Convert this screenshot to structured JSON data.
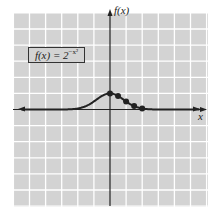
{
  "chart_data": {
    "type": "line",
    "title": "",
    "function_label": {
      "lhs": "f(x) = 2",
      "exponent": "−x²"
    },
    "xlabel": "x",
    "ylabel": "f(x)",
    "xlim": [
      -6,
      6
    ],
    "ylim": [
      -6,
      6
    ],
    "grid": true,
    "grid_step": 1,
    "curve": {
      "x": [
        -6,
        -3,
        -2,
        -1.5,
        -1,
        -0.5,
        0,
        0.5,
        1,
        1.5,
        2,
        3,
        6
      ],
      "y": [
        0,
        0.002,
        0.06,
        0.21,
        0.5,
        0.84,
        1,
        0.84,
        0.5,
        0.21,
        0.06,
        0.002,
        0
      ]
    },
    "points": {
      "x": [
        0,
        0.5,
        1,
        1.5,
        2
      ],
      "y": [
        1,
        0.84,
        0.5,
        0.21,
        0.06
      ]
    },
    "colors": {
      "background": "#d3d3d3",
      "grid": "#ffffff",
      "curve": "#222222",
      "axes": "#222222"
    }
  }
}
